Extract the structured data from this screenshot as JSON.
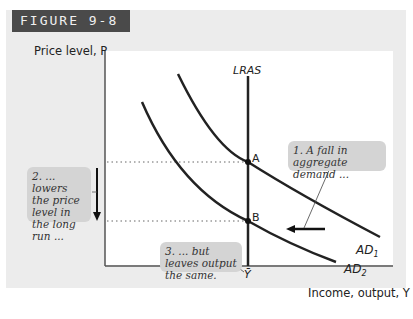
{
  "figure": {
    "label": "FIGURE 9-8",
    "y_axis_label": "Price level, P",
    "x_axis_label": "Income, output, Y",
    "x_tick": "Ȳ",
    "curves": {
      "lras": "LRAS",
      "ad1": "AD",
      "ad1_sub": "1",
      "ad2": "AD",
      "ad2_sub": "2"
    },
    "points": {
      "a": "A",
      "b": "B"
    },
    "annotations": {
      "one": "1. A fall in aggregate demand ...",
      "two": "2. ... lowers the price level in the long run ...",
      "three": "3. ... but leaves output the same."
    },
    "colors": {
      "panel_bg": "#ececec",
      "badge_bg": "#4a4a4a",
      "callout_bg": "#d4d4d4",
      "curve": "#222222"
    }
  }
}
